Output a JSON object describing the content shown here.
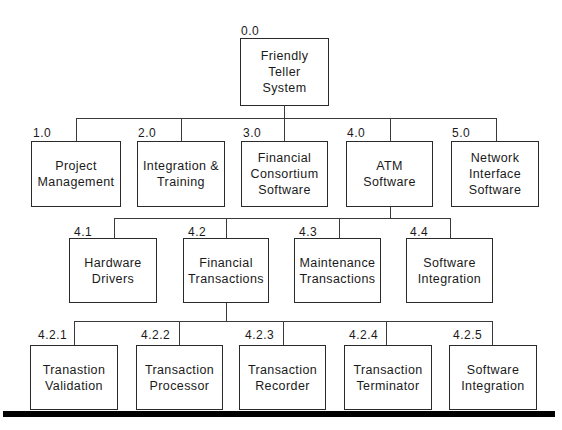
{
  "diagram": {
    "type": "work-breakdown-structure",
    "root": {
      "code": "0.0",
      "label": "Friendly\nTeller\nSystem"
    },
    "level1": [
      {
        "code": "1.0",
        "label": "Project\nManagement"
      },
      {
        "code": "2.0",
        "label": "Integration &\nTraining"
      },
      {
        "code": "3.0",
        "label": "Financial\nConsortium\nSoftware"
      },
      {
        "code": "4.0",
        "label": "ATM\nSoftware"
      },
      {
        "code": "5.0",
        "label": "Network\nInterface\nSoftware"
      }
    ],
    "level2": {
      "parent": "4.0",
      "items": [
        {
          "code": "4.1",
          "label": "Hardware\nDrivers"
        },
        {
          "code": "4.2",
          "label": "Financial\nTransactions"
        },
        {
          "code": "4.3",
          "label": "Maintenance\nTransactions"
        },
        {
          "code": "4.4",
          "label": "Software\nIntegration"
        }
      ]
    },
    "level3": {
      "parent": "4.2",
      "items": [
        {
          "code": "4.2.1",
          "label": "Tranastion\nValidation"
        },
        {
          "code": "4.2.2",
          "label": "Transaction\nProcessor"
        },
        {
          "code": "4.2.3",
          "label": "Transaction\nRecorder"
        },
        {
          "code": "4.2.4",
          "label": "Transaction\nTerminator"
        },
        {
          "code": "4.2.5",
          "label": "Software\nIntegration"
        }
      ]
    },
    "colors": {
      "line": "#3a3a3a",
      "box_border": "#2a2a2a",
      "text": "#1a1a1a",
      "bar": "#000000"
    }
  }
}
